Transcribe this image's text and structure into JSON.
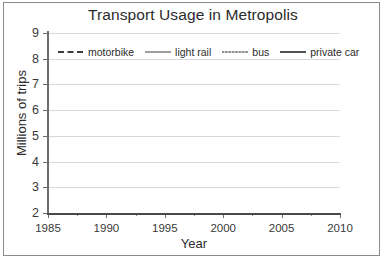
{
  "chart_data": {
    "type": "line",
    "title": "Transport Usage in Metropolis",
    "xlabel": "Year",
    "ylabel": "Millions of trips",
    "x": [
      1985,
      1990,
      1995,
      2000,
      2005,
      2010
    ],
    "xticklabels": [
      "1985",
      "1990",
      "1995",
      "2000",
      "2005",
      "2010"
    ],
    "xlim": [
      1985,
      2010
    ],
    "ylim": [
      2,
      9
    ],
    "yticks": [
      2,
      3,
      4,
      5,
      6,
      7,
      8,
      9
    ],
    "yticklabels": [
      "2",
      "3",
      "4",
      "5",
      "6",
      "7",
      "8",
      "9"
    ],
    "grid": "horizontal",
    "legend_position": "upper-left-inside",
    "series": [
      {
        "name": "motorbike",
        "values": [
          3.4,
          3.7,
          3.2,
          3.5,
          3.6,
          3.8
        ],
        "style": "dashed",
        "color": "#3d3d3d"
      },
      {
        "name": "light rail",
        "values": [
          4.6,
          4.8,
          6.1,
          7.5,
          7.75,
          8.3
        ],
        "style": "solid",
        "color": "#9a9a9a"
      },
      {
        "name": "bus",
        "values": [
          5.1,
          5.3,
          5.15,
          5.3,
          6.1,
          7.1
        ],
        "style": "dotted",
        "color": "#6a6a6a"
      },
      {
        "name": "private car",
        "values": [
          6.2,
          6.4,
          6.35,
          6.1,
          6.1,
          5.9
        ],
        "style": "solid",
        "color": "#4a4a4a"
      }
    ]
  },
  "colors": {
    "background": "#ffffff",
    "frame": "#8a8a8a",
    "grid": "#d9d9d9",
    "axis": "#6d6d6d",
    "text": "#2b2b2b"
  },
  "icons": {
    "legend_motorbike": "dashed-line-swatch",
    "legend_light_rail": "solid-line-swatch",
    "legend_bus": "dotted-line-swatch",
    "legend_private_car": "solid-line-swatch"
  }
}
